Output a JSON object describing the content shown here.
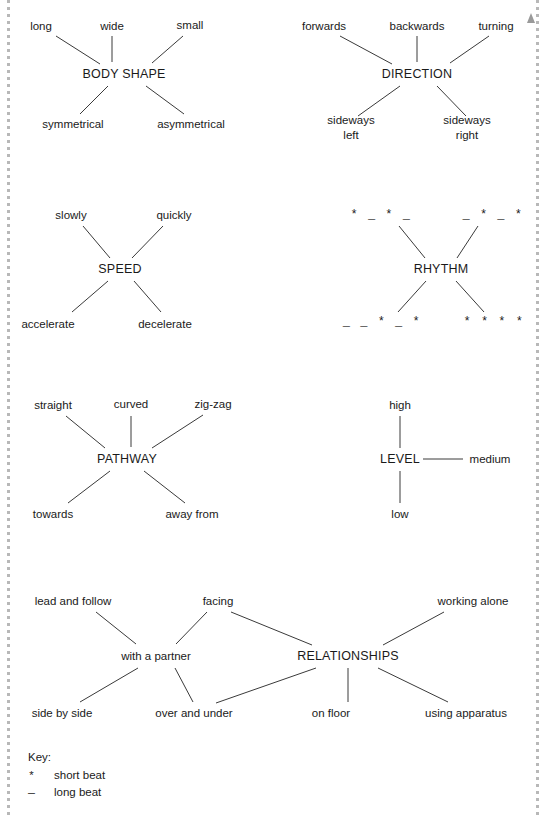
{
  "page": {
    "line_color": "#3a3a3a",
    "text_color": "#1a1a1a",
    "rail_color": "#b8b8b8"
  },
  "clusters": [
    {
      "id": "body-shape",
      "hub": "BODY SHAPE",
      "hub_pos": [
        124,
        74
      ],
      "nodes": [
        {
          "label": "long",
          "pos": [
            41,
            26
          ]
        },
        {
          "label": "wide",
          "pos": [
            112,
            26
          ]
        },
        {
          "label": "small",
          "pos": [
            190,
            25
          ]
        },
        {
          "label": "symmetrical",
          "pos": [
            73,
            124
          ]
        },
        {
          "label": "asymmetrical",
          "pos": [
            191,
            124
          ]
        }
      ]
    },
    {
      "id": "direction",
      "hub": "DIRECTION",
      "hub_pos": [
        417,
        74
      ],
      "nodes": [
        {
          "label": "forwards",
          "pos": [
            324,
            26
          ]
        },
        {
          "label": "backwards",
          "pos": [
            417,
            26
          ]
        },
        {
          "label": "turning",
          "pos": [
            496,
            26
          ]
        },
        {
          "label": "sideways\nleft",
          "pos": [
            351,
            128
          ]
        },
        {
          "label": "sideways\nright",
          "pos": [
            467,
            128
          ]
        }
      ]
    },
    {
      "id": "speed",
      "hub": "SPEED",
      "hub_pos": [
        120,
        269
      ],
      "nodes": [
        {
          "label": "slowly",
          "pos": [
            71,
            215
          ]
        },
        {
          "label": "quickly",
          "pos": [
            174,
            215
          ]
        },
        {
          "label": "accelerate",
          "pos": [
            48,
            324
          ]
        },
        {
          "label": "decelerate",
          "pos": [
            165,
            324
          ]
        }
      ]
    },
    {
      "id": "rhythm",
      "hub": "RHYTHM",
      "hub_pos": [
        441,
        269
      ],
      "nodes": [
        {
          "label": "*  _  *  _",
          "pos": [
            381,
            215
          ],
          "kind": "beat"
        },
        {
          "label": "_  *  _  *",
          "pos": [
            493,
            215
          ],
          "kind": "beat"
        },
        {
          "label": "_  _  *  _  *",
          "pos": [
            382,
            322
          ],
          "kind": "beat"
        },
        {
          "label": "*  *  *  *",
          "pos": [
            494,
            322
          ],
          "kind": "beat"
        }
      ]
    },
    {
      "id": "pathway",
      "hub": "PATHWAY",
      "hub_pos": [
        127,
        459
      ],
      "nodes": [
        {
          "label": "straight",
          "pos": [
            53,
            405
          ]
        },
        {
          "label": "curved",
          "pos": [
            131,
            404
          ]
        },
        {
          "label": "zig-zag",
          "pos": [
            213,
            404
          ]
        },
        {
          "label": "towards",
          "pos": [
            53,
            514
          ]
        },
        {
          "label": "away from",
          "pos": [
            192,
            514
          ]
        }
      ]
    },
    {
      "id": "level",
      "hub": "LEVEL",
      "hub_pos": [
        400,
        459
      ],
      "nodes": [
        {
          "label": "high",
          "pos": [
            400,
            405
          ]
        },
        {
          "label": "medium",
          "pos": [
            490,
            459
          ]
        },
        {
          "label": "low",
          "pos": [
            400,
            514
          ]
        }
      ]
    },
    {
      "id": "relationships",
      "hub": "RELATIONSHIPS",
      "hub_pos": [
        348,
        656
      ],
      "nodes": [
        {
          "label": "with a partner",
          "pos": [
            156,
            656
          ]
        },
        {
          "label": "lead and follow",
          "pos": [
            73,
            601
          ]
        },
        {
          "label": "facing",
          "pos": [
            218,
            601
          ]
        },
        {
          "label": "working alone",
          "pos": [
            473,
            601
          ]
        },
        {
          "label": "side by side",
          "pos": [
            62,
            713
          ]
        },
        {
          "label": "over and under",
          "pos": [
            194,
            713
          ]
        },
        {
          "label": "on floor",
          "pos": [
            331,
            713
          ]
        },
        {
          "label": "using apparatus",
          "pos": [
            466,
            713
          ]
        }
      ]
    }
  ],
  "edges": [
    {
      "from": [
        56,
        36
      ],
      "to": [
        100,
        64
      ]
    },
    {
      "from": [
        112,
        36
      ],
      "to": [
        112,
        62
      ]
    },
    {
      "from": [
        183,
        36
      ],
      "to": [
        152,
        63
      ]
    },
    {
      "from": [
        108,
        86
      ],
      "to": [
        80,
        114
      ]
    },
    {
      "from": [
        146,
        86
      ],
      "to": [
        184,
        114
      ]
    },
    {
      "from": [
        340,
        36
      ],
      "to": [
        392,
        64
      ]
    },
    {
      "from": [
        417,
        36
      ],
      "to": [
        417,
        62
      ]
    },
    {
      "from": [
        489,
        36
      ],
      "to": [
        450,
        63
      ]
    },
    {
      "from": [
        400,
        86
      ],
      "to": [
        358,
        116
      ]
    },
    {
      "from": [
        437,
        86
      ],
      "to": [
        466,
        116
      ]
    },
    {
      "from": [
        83,
        226
      ],
      "to": [
        110,
        258
      ]
    },
    {
      "from": [
        163,
        226
      ],
      "to": [
        132,
        258
      ]
    },
    {
      "from": [
        108,
        281
      ],
      "to": [
        72,
        312
      ]
    },
    {
      "from": [
        134,
        281
      ],
      "to": [
        161,
        312
      ]
    },
    {
      "from": [
        399,
        226
      ],
      "to": [
        425,
        258
      ]
    },
    {
      "from": [
        478,
        226
      ],
      "to": [
        457,
        258
      ]
    },
    {
      "from": [
        426,
        281
      ],
      "to": [
        398,
        312
      ]
    },
    {
      "from": [
        456,
        281
      ],
      "to": [
        484,
        312
      ]
    },
    {
      "from": [
        66,
        416
      ],
      "to": [
        105,
        448
      ]
    },
    {
      "from": [
        131,
        416
      ],
      "to": [
        131,
        447
      ]
    },
    {
      "from": [
        203,
        415
      ],
      "to": [
        152,
        448
      ]
    },
    {
      "from": [
        110,
        471
      ],
      "to": [
        68,
        503
      ]
    },
    {
      "from": [
        144,
        471
      ],
      "to": [
        185,
        503
      ]
    },
    {
      "from": [
        400,
        416
      ],
      "to": [
        400,
        448
      ]
    },
    {
      "from": [
        423,
        459
      ],
      "to": [
        463,
        459
      ]
    },
    {
      "from": [
        400,
        471
      ],
      "to": [
        400,
        503
      ]
    },
    {
      "from": [
        96,
        612
      ],
      "to": [
        136,
        644
      ]
    },
    {
      "from": [
        207,
        612
      ],
      "to": [
        176,
        644
      ]
    },
    {
      "from": [
        231,
        612
      ],
      "to": [
        312,
        645
      ]
    },
    {
      "from": [
        138,
        668
      ],
      "to": [
        80,
        702
      ]
    },
    {
      "from": [
        175,
        668
      ],
      "to": [
        193,
        702
      ]
    },
    {
      "from": [
        316,
        668
      ],
      "to": [
        216,
        703
      ]
    },
    {
      "from": [
        348,
        668
      ],
      "to": [
        348,
        702
      ]
    },
    {
      "from": [
        378,
        668
      ],
      "to": [
        448,
        702
      ]
    },
    {
      "from": [
        383,
        645
      ],
      "to": [
        444,
        612
      ]
    }
  ],
  "key": {
    "title": "Key:",
    "items": [
      {
        "symbol": "*",
        "label": "short beat"
      },
      {
        "symbol": "—",
        "label": "long beat"
      }
    ]
  }
}
